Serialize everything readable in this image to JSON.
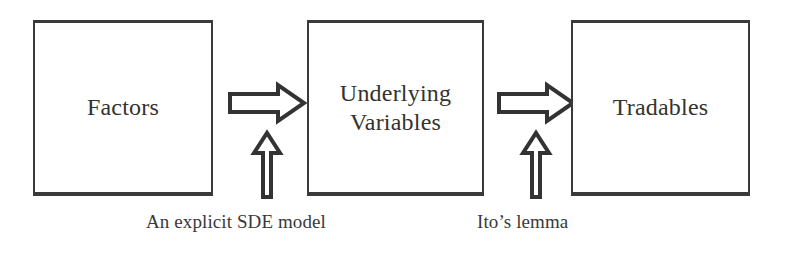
{
  "diagram": {
    "background_color": "#ffffff",
    "stroke_color": "#333333",
    "text_color": "#33332f",
    "nodes": [
      {
        "id": "factors",
        "label": "Factors"
      },
      {
        "id": "underlying",
        "label": "Underlying\nVariables"
      },
      {
        "id": "tradables",
        "label": "Tradables"
      }
    ],
    "arrows": [
      {
        "id": "factors-to-underlying",
        "direction": "right",
        "style": "hollow-block-arrow"
      },
      {
        "id": "sde-model-up",
        "direction": "up",
        "style": "hollow-block-arrow"
      },
      {
        "id": "underlying-to-tradables",
        "direction": "right",
        "style": "hollow-block-arrow"
      },
      {
        "id": "ito-lemma-up",
        "direction": "up",
        "style": "hollow-block-arrow"
      }
    ],
    "captions": [
      {
        "id": "sde",
        "text": "An explicit  SDE model"
      },
      {
        "id": "ito",
        "text": "Ito’s lemma"
      }
    ]
  }
}
